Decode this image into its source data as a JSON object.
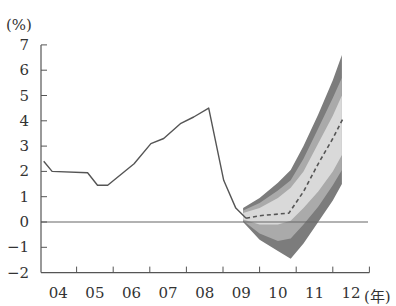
{
  "chart_data": {
    "type": "area",
    "title": "",
    "ylabel": "(%)",
    "xlabel": "(年)",
    "ylim": [
      -2,
      7
    ],
    "yticks": [
      7,
      6,
      5,
      4,
      3,
      2,
      1,
      0,
      -1,
      -2
    ],
    "xticks": [
      "04",
      "05",
      "06",
      "07",
      "08",
      "09",
      "10",
      "11",
      "12"
    ],
    "x_unit": "(年)",
    "grid": false,
    "legend": null,
    "series": [
      {
        "name": "actual",
        "style": "solid",
        "points": [
          [
            2004.1,
            2.4
          ],
          [
            2004.33,
            2.0
          ],
          [
            2005.3,
            1.95
          ],
          [
            2005.57,
            1.45
          ],
          [
            2005.85,
            1.45
          ],
          [
            2006.57,
            2.3
          ],
          [
            2007.03,
            3.1
          ],
          [
            2007.38,
            3.3
          ],
          [
            2007.85,
            3.9
          ],
          [
            2008.2,
            4.15
          ],
          [
            2008.61,
            4.5
          ],
          [
            2009.02,
            1.65
          ],
          [
            2009.35,
            0.55
          ],
          [
            2009.63,
            0.15
          ]
        ]
      },
      {
        "name": "projection-median",
        "style": "dashed",
        "points": [
          [
            2009.63,
            0.15
          ],
          [
            2010.0,
            0.25
          ],
          [
            2010.8,
            0.35
          ],
          [
            2011.2,
            1.2
          ],
          [
            2011.6,
            2.3
          ],
          [
            2012.0,
            3.3
          ],
          [
            2012.3,
            4.15
          ]
        ]
      }
    ],
    "fan_bands": {
      "x": [
        2009.55,
        2010.0,
        2010.5,
        2010.85,
        2011.2,
        2011.6,
        2012.0,
        2012.25
      ],
      "outer_upper": [
        0.55,
        0.95,
        1.55,
        2.05,
        3.0,
        4.25,
        5.6,
        6.6
      ],
      "middle_upper": [
        0.45,
        0.75,
        1.25,
        1.65,
        2.5,
        3.7,
        4.9,
        5.7
      ],
      "inner_upper": [
        0.35,
        0.55,
        0.95,
        1.35,
        2.0,
        3.1,
        4.2,
        5.0
      ],
      "inner_lower": [
        0.1,
        -0.1,
        -0.1,
        0.05,
        0.55,
        1.2,
        2.0,
        2.65
      ],
      "middle_lower": [
        0.05,
        -0.45,
        -0.75,
        -0.65,
        -0.1,
        0.6,
        1.45,
        2.05
      ],
      "outer_lower": [
        0.0,
        -0.7,
        -1.15,
        -1.45,
        -0.85,
        0.0,
        0.85,
        1.5
      ]
    },
    "colors": {
      "line": "#555555",
      "outer_band": "#7c7c7c",
      "middle_band": "#aaaaaa",
      "inner_band": "#d9d9d9",
      "zero_line": "#666666",
      "axis": "#555555"
    }
  }
}
